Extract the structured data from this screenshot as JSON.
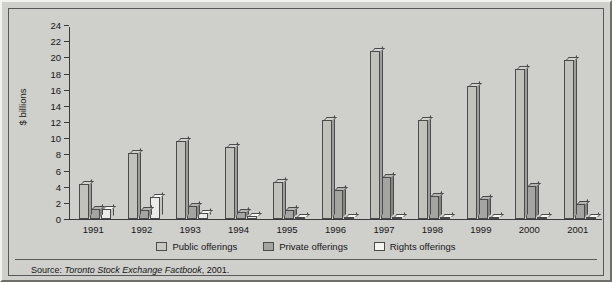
{
  "chart_data": {
    "type": "bar",
    "title": "",
    "xlabel": "",
    "ylabel": "$ billions",
    "ylim": [
      0,
      24
    ],
    "yticks": [
      0,
      2,
      4,
      6,
      8,
      10,
      12,
      14,
      16,
      18,
      20,
      22,
      24
    ],
    "grid": false,
    "legend_position": "bottom",
    "categories": [
      "1991",
      "1992",
      "1993",
      "1994",
      "1995",
      "1996",
      "1997",
      "1998",
      "1999",
      "2000",
      "2001"
    ],
    "series": [
      {
        "name": "Public offerings",
        "color": "#c2c2bd",
        "values": [
          4.3,
          8.2,
          9.6,
          8.9,
          4.6,
          12.2,
          20.8,
          12.3,
          16.4,
          18.6,
          19.7
        ]
      },
      {
        "name": "Private offerings",
        "color": "#a4a4a0",
        "values": [
          1.2,
          1.1,
          1.6,
          0.9,
          1.1,
          3.6,
          5.2,
          2.9,
          2.5,
          4.1,
          1.8
        ]
      },
      {
        "name": "Rights offerings",
        "color": "#ebebe7",
        "values": [
          1.3,
          2.7,
          0.8,
          0.4,
          0.3,
          0.3,
          0.2,
          0.3,
          0.3,
          0.2,
          0.3
        ]
      }
    ],
    "source_prefix": "Source: ",
    "source_title": "Toronto Stock Exchange Factbook",
    "source_suffix": ", 2001."
  },
  "axis": {
    "y_title": "$ billions"
  },
  "legend": {
    "items": [
      {
        "label": "Public offerings",
        "swatch": "legend-swatch-public"
      },
      {
        "label": "Private offerings",
        "swatch": "legend-swatch-private"
      },
      {
        "label": "Rights offerings",
        "swatch": "legend-swatch-rights"
      }
    ]
  },
  "source": {
    "prefix": "Source: ",
    "title": "Toronto Stock Exchange Factbook",
    "suffix": ", 2001."
  }
}
